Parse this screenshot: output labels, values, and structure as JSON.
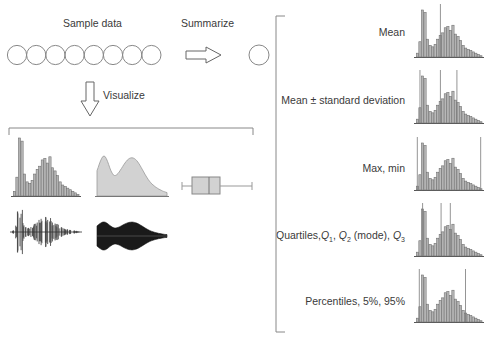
{
  "labels": {
    "sample_data": "Sample data",
    "summarize": "Summarize",
    "visualize": "Visualize"
  },
  "sample_circles": 8,
  "colors": {
    "stroke": "#888888",
    "bar_fill": "#c8c8c8",
    "bar_stroke": "#6e6e6e",
    "density_fill": "#d2d2d2",
    "violin_fill": "#1a1a1a",
    "beeswarm": "#4a4a4a",
    "marker_line": "#7a7a7a"
  },
  "histogram_bins": [
    3,
    12,
    37,
    35,
    14,
    9,
    8,
    10,
    14,
    17,
    19,
    23,
    24,
    21,
    25,
    18,
    16,
    13,
    9,
    7,
    6,
    5,
    4,
    3,
    2,
    1
  ],
  "visualizations": [
    {
      "name": "histogram"
    },
    {
      "name": "density-plot"
    },
    {
      "name": "box-plot"
    },
    {
      "name": "beeswarm-plot"
    },
    {
      "name": "violin-plot"
    }
  ],
  "summaries": [
    {
      "label": "Mean",
      "markers": [
        0.37
      ]
    },
    {
      "label": "Mean ± standard deviation",
      "markers": [
        0.06,
        0.37,
        0.62
      ]
    },
    {
      "label": "Max, min",
      "markers": [
        0.02,
        0.98
      ]
    },
    {
      "label_parts": [
        "Quartiles,",
        "Q",
        "1",
        ", ",
        "Q",
        "2",
        " (mode), ",
        "Q",
        "3"
      ],
      "label": "Quartiles, Q1, Q2 (mode), Q3",
      "markers": [
        0.1,
        0.38,
        0.52
      ]
    },
    {
      "label": "Percentiles, 5%, 95%",
      "markers": [
        0.05,
        0.75
      ]
    }
  ],
  "chart_data": {
    "type": "bar",
    "title": "",
    "categories": [
      "1",
      "2",
      "3",
      "4",
      "5",
      "6",
      "7",
      "8",
      "9",
      "10",
      "11",
      "12",
      "13",
      "14",
      "15",
      "16",
      "17",
      "18",
      "19",
      "20",
      "21",
      "22",
      "23",
      "24",
      "25",
      "26"
    ],
    "values": [
      3,
      12,
      37,
      35,
      14,
      9,
      8,
      10,
      14,
      17,
      19,
      23,
      24,
      21,
      25,
      18,
      16,
      13,
      9,
      7,
      6,
      5,
      4,
      3,
      2,
      1
    ],
    "xlabel": "",
    "ylabel": ""
  }
}
